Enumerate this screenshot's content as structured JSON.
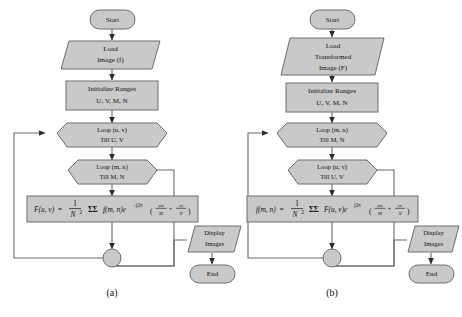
{
  "figure": {
    "background_color": "#ffffff",
    "shape_fill": "#c9c9c9",
    "shape_stroke": "#6e6e6e",
    "line_color": "#6a6a6a"
  },
  "panels": [
    {
      "id": "a",
      "caption": "(a)",
      "nodes": {
        "start": "Start",
        "load_line1": "Load",
        "load_line2": "Image (f)",
        "init_line1": "Initialize Ranges",
        "init_line2": "U, V, M, N",
        "loop_outer_line1": "Loop (u, v)",
        "loop_outer_line2": "Till U, V",
        "loop_inner_line1": "Loop (m, n)",
        "loop_inner_line2": "Till M, N",
        "display_line1": "Display",
        "display_line2": "Images",
        "end": "End"
      },
      "formula": {
        "lhs_func": "F",
        "lhs_args": "(u, v)",
        "equals": "=",
        "frac_num": "1",
        "frac_den_base": "N",
        "frac_den_exp": "2",
        "sum": "ΣΣ",
        "inner_func": "f",
        "inner_args": "(m, n)",
        "exp_base": "e",
        "exp_sign": "−",
        "exp_coeff": "j2π",
        "term1_num": "um",
        "term1_den": "M",
        "plus": "+",
        "term2_num": "vn",
        "term2_den": "N",
        "plain": "F(u, v) = (1/N^2) ΣΣ f(m, n)e^-j2π(um/M + vn/N)"
      }
    },
    {
      "id": "b",
      "caption": "(b)",
      "nodes": {
        "start": "Start",
        "load_line1": "Load",
        "load_line2": "Transformed",
        "load_line3": "Image (F)",
        "init_line1": "Initialize Ranges",
        "init_line2": "U, V, M, N",
        "loop_outer_line1": "Loop (m, n)",
        "loop_outer_line2": "Till M, N",
        "loop_inner_line1": "Loop (u, v)",
        "loop_inner_line2": "Till U, V",
        "display_line1": "Display",
        "display_line2": "Images",
        "end": "End"
      },
      "formula": {
        "lhs_func": "f",
        "lhs_args": "(m, n)",
        "equals": "=",
        "frac_num": "1",
        "frac_den_base": "N",
        "frac_den_exp": "2",
        "sum": "ΣΣ",
        "inner_func": "F",
        "inner_args": "(u, v)",
        "exp_base": "e",
        "exp_sign": "",
        "exp_coeff": "j2π",
        "term1_num": "um",
        "term1_den": "M",
        "plus": "+",
        "term2_num": "vn",
        "term2_den": "N",
        "plain": "f(m, n) = (1/N^2) ΣΣ F(u, v)e^j2π(um/M + vn/N)"
      }
    }
  ]
}
